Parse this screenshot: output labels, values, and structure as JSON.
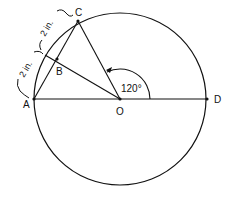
{
  "diagram": {
    "type": "geometry-circle",
    "points": {
      "A": {
        "label": "A",
        "x": 34,
        "y": 99
      },
      "B": {
        "label": "B",
        "x": 57,
        "y": 59
      },
      "C": {
        "label": "C",
        "x": 78,
        "y": 21
      },
      "O": {
        "label": "O",
        "x": 120,
        "y": 99
      },
      "D": {
        "label": "D",
        "x": 207,
        "y": 99
      }
    },
    "circle": {
      "cx": 120,
      "cy": 99,
      "r": 86
    },
    "angle_label": "120°",
    "dimension_labels": {
      "upper": "2 in.",
      "lower": "2 in."
    },
    "colors": {
      "stroke": "#111111",
      "background": "#ffffff"
    }
  }
}
